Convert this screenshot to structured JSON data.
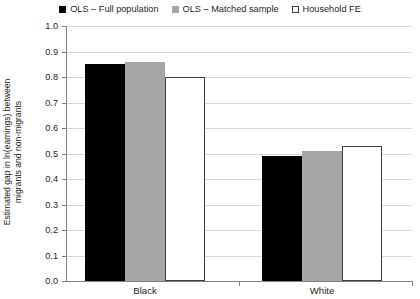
{
  "chart_data": {
    "type": "bar",
    "title": "",
    "subtitle": "",
    "xlabel": "",
    "ylabel": "Estimated gap in ln(earnings) between migrants and non-migrants",
    "ylabel_line1": "Estimated gap in ln(earnings) between",
    "ylabel_line2": "migrants and non-migrants",
    "categories": [
      "Black",
      "White"
    ],
    "series": [
      {
        "name": "OLS – Full population",
        "color": "#000000",
        "values": [
          0.85,
          0.49
        ]
      },
      {
        "name": "OLS – Matched sample",
        "color": "#a6a6a6",
        "values": [
          0.86,
          0.51
        ]
      },
      {
        "name": "Household FE",
        "color": "#ffffff",
        "values": [
          0.8,
          0.53
        ]
      }
    ],
    "ylim": [
      0.0,
      1.0
    ],
    "ytick_values": [
      1.0,
      0.9,
      0.8,
      0.7,
      0.6,
      0.5,
      0.4,
      0.3,
      0.2,
      0.1,
      0.0
    ],
    "ytick_labels": [
      "1.0",
      "0.9",
      "0.8",
      "0.7",
      "0.6",
      "0.5",
      "0.4",
      "0.3",
      "0.2",
      "0.1",
      "0.0"
    ],
    "grid": true,
    "grid_axis": "y",
    "legend_position": "top-center"
  },
  "legend": {
    "items": [
      {
        "label": "OLS – Full population",
        "swatch": "filled-black-square-icon"
      },
      {
        "label": "OLS – Matched sample",
        "swatch": "filled-gray-square-icon"
      },
      {
        "label": "Household FE",
        "swatch": "outlined-white-square-icon"
      }
    ]
  },
  "yaxis": {
    "labels": [
      "1.0",
      "0.9",
      "0.8",
      "0.7",
      "0.6",
      "0.5",
      "0.4",
      "0.3",
      "0.2",
      "0.1",
      "0.0"
    ]
  },
  "xaxis": {
    "labels": [
      "Black",
      "White"
    ]
  },
  "colors": {
    "series_full": "#000000",
    "series_matched": "#a6a6a6",
    "series_hhfe": "#ffffff",
    "hhfe_border": "#3f3f3f",
    "gridline": "#d9d9d9",
    "axis": "#808080",
    "text": "#231f20",
    "background": "#ffffff"
  }
}
